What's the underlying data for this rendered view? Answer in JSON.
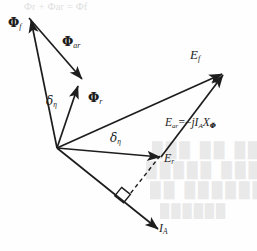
{
  "figure": {
    "kind": "phasor-diagram",
    "title_faint_cropped": "Φr + Φar = Φf",
    "background_color": "#fefefe",
    "stroke_color": "#1d1d1d",
    "width": 257,
    "height": 251
  },
  "labels": {
    "phi_f": {
      "symbol": "Φ",
      "subscript": "f"
    },
    "phi_ar": {
      "symbol": "Φ",
      "subscript": "ar"
    },
    "phi_r": {
      "symbol": "Φ",
      "subscript": "r"
    },
    "delta_eta_1": {
      "symbol": "δ",
      "subscript": "η"
    },
    "delta_eta_2": {
      "symbol": "δ",
      "subscript": "η"
    },
    "e_f": {
      "symbol": "E",
      "subscript": "f"
    },
    "e_r": {
      "symbol": "E",
      "subscript": "r"
    },
    "i_a": {
      "symbol": "I",
      "subscript": "A"
    },
    "e_ar_equation": {
      "lhs_symbol": "E",
      "lhs_subscript": "ar",
      "equals": "=",
      "minus": "−",
      "j": "j",
      "current_symbol": "I",
      "current_subscript": "A",
      "reactance_symbol": "X",
      "reactance_subscript": "Φ"
    }
  },
  "bleed_through": {
    "line_1": "███ ██ ████",
    "line_2": "█████ ████ ██",
    "line_3": "██ ██████ ██",
    "line_4": "██████"
  },
  "vectors": [
    {
      "name": "phi-f",
      "from": [
        57,
        148
      ],
      "to": [
        29,
        17
      ],
      "arrow": true,
      "style": "solid"
    },
    {
      "name": "phi-ar",
      "from": [
        29,
        17
      ],
      "to": [
        83,
        81
      ],
      "arrow": true,
      "style": "solid"
    },
    {
      "name": "phi-r",
      "from": [
        57,
        148
      ],
      "to": [
        79,
        87
      ],
      "arrow": true,
      "style": "solid"
    },
    {
      "name": "e-f",
      "from": [
        57,
        148
      ],
      "to": [
        224,
        73
      ],
      "arrow": true,
      "style": "solid"
    },
    {
      "name": "e-r",
      "from": [
        57,
        148
      ],
      "to": [
        161,
        157
      ],
      "arrow": true,
      "style": "solid"
    },
    {
      "name": "e-ar",
      "from": [
        161,
        157
      ],
      "to": [
        224,
        73
      ],
      "arrow": true,
      "style": "solid"
    },
    {
      "name": "i-a",
      "from": [
        57,
        148
      ],
      "to": [
        160,
        230
      ],
      "arrow": true,
      "style": "solid"
    },
    {
      "name": "perpendicular-dropline",
      "from": [
        161,
        157
      ],
      "to": [
        128,
        197
      ],
      "arrow": false,
      "style": "dashed"
    }
  ],
  "markers": {
    "right_angle": {
      "at": [
        128,
        197
      ],
      "note": "square right-angle marker between I_A line and dashed drop line"
    }
  }
}
